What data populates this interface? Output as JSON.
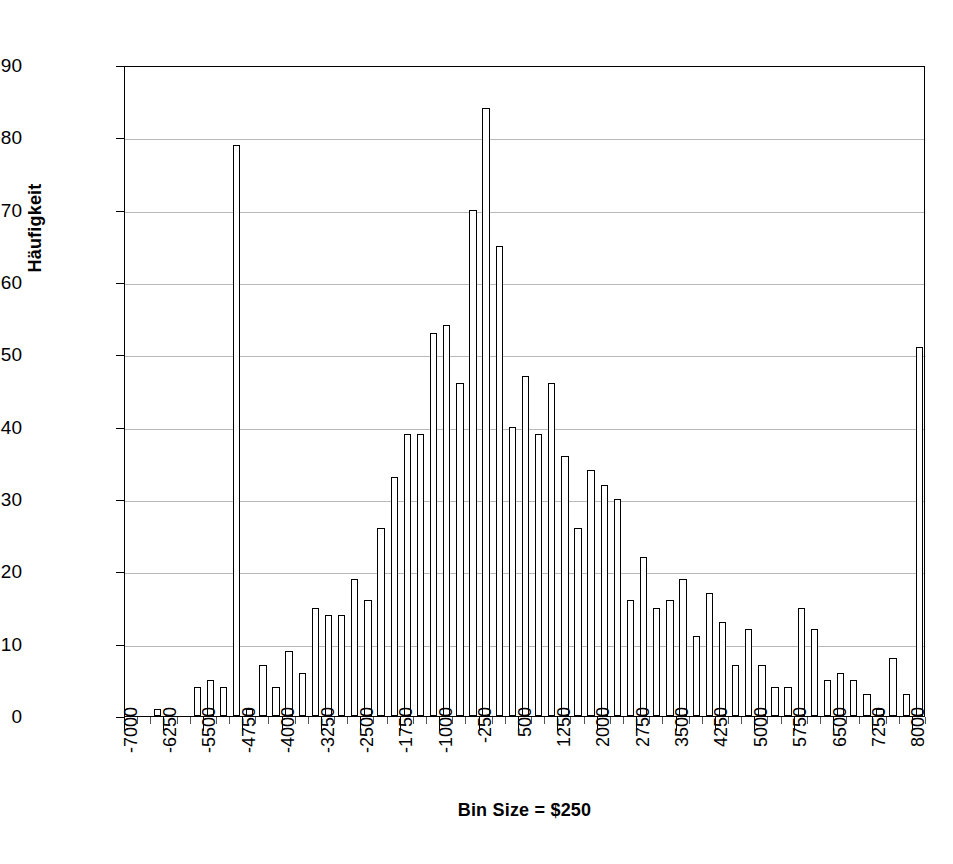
{
  "chart_data": {
    "type": "bar",
    "title": "",
    "subtitle": "",
    "xlabel": "Bin Size = $250",
    "ylabel": "Häufigkeit",
    "ylim": [
      0,
      90
    ],
    "ytick_step": 10,
    "yticks": [
      0,
      10,
      20,
      30,
      40,
      50,
      60,
      70,
      80,
      90
    ],
    "grid": true,
    "grid_axis": "y",
    "legend": false,
    "legend_position": "none",
    "bin_size": 250,
    "xtick_labels": [
      "-7000",
      "-6250",
      "-5500",
      "-4750",
      "-4000",
      "-3250",
      "-2500",
      "-1750",
      "-1000",
      "-250",
      "500",
      "1250",
      "2000",
      "2750",
      "3500",
      "4250",
      "5000",
      "5750",
      "6500",
      "7250",
      "8000"
    ],
    "xtick_label_step_bins": 3,
    "categories": [
      "-7000",
      "-6750",
      "-6500",
      "-6250",
      "-6000",
      "-5750",
      "-5500",
      "-5250",
      "-5000",
      "-4750",
      "-4500",
      "-4250",
      "-4000",
      "-3750",
      "-3500",
      "-3250",
      "-3000",
      "-2750",
      "-2500",
      "-2250",
      "-2000",
      "-1750",
      "-1500",
      "-1250",
      "-1000",
      "-750",
      "-500",
      "-250",
      "0",
      "250",
      "500",
      "750",
      "1000",
      "1250",
      "1500",
      "1750",
      "2000",
      "2250",
      "2500",
      "2750",
      "3000",
      "3250",
      "3500",
      "3750",
      "4000",
      "4250",
      "4500",
      "4750",
      "5000",
      "5250",
      "5500",
      "5750",
      "6000",
      "6250",
      "6500",
      "6750",
      "7000",
      "7250",
      "7500",
      "7750",
      "8000"
    ],
    "values": [
      0,
      0,
      1,
      0,
      0,
      4,
      5,
      4,
      79,
      1,
      7,
      4,
      9,
      6,
      15,
      14,
      14,
      19,
      16,
      26,
      33,
      39,
      39,
      53,
      54,
      46,
      70,
      84,
      65,
      40,
      47,
      39,
      46,
      36,
      26,
      34,
      32,
      30,
      16,
      22,
      15,
      16,
      19,
      11,
      17,
      13,
      7,
      12,
      7,
      4,
      4,
      15,
      12,
      5,
      6,
      5,
      3,
      1,
      8,
      3,
      51
    ],
    "series_name": "Häufigkeit",
    "colors": {
      "bar_fill": "#ffffff",
      "bar_stroke": "#000000",
      "gridline": "#b8b8b8",
      "axis": "#000000",
      "text": "#000000",
      "background": "#ffffff"
    }
  }
}
